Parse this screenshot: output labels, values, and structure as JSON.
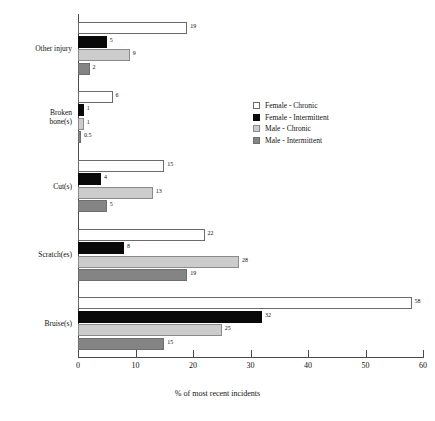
{
  "chart_data": {
    "type": "bar",
    "orientation": "horizontal",
    "title": "",
    "xlabel": "% of most recent incidents",
    "ylabel": "",
    "xlim": [
      0,
      60
    ],
    "xticks": [
      0,
      10,
      20,
      30,
      40,
      50,
      60
    ],
    "xtick_labels": [
      "0",
      "10",
      "20",
      "30",
      "40",
      "50",
      "60"
    ],
    "grid": false,
    "legend_position": "center-right",
    "categories": [
      "Other injury",
      "Broken\nbone(s)",
      "Cut(s)",
      "Scratch(es)",
      "Bruise(s)"
    ],
    "series": [
      {
        "name": "Female - Chronic",
        "color": "#ffffff",
        "values": [
          19,
          6,
          15,
          22,
          58
        ],
        "labels": [
          "19",
          "6",
          "15",
          "22",
          "58"
        ]
      },
      {
        "name": "Female - Intermittent",
        "color": "#090909",
        "values": [
          5,
          1,
          4,
          8,
          32
        ],
        "labels": [
          "5",
          "1",
          "4",
          "8",
          "32"
        ]
      },
      {
        "name": "Male - Chronic",
        "color": "#cccccc",
        "values": [
          9,
          1,
          13,
          28,
          25
        ],
        "labels": [
          "9",
          "1",
          "13",
          "28",
          "25"
        ]
      },
      {
        "name": "Male - Intermittent",
        "color": "#848484",
        "values": [
          2,
          0.5,
          5,
          19,
          15
        ],
        "labels": [
          "2",
          "0.5",
          "5",
          "19",
          "15"
        ]
      }
    ]
  }
}
